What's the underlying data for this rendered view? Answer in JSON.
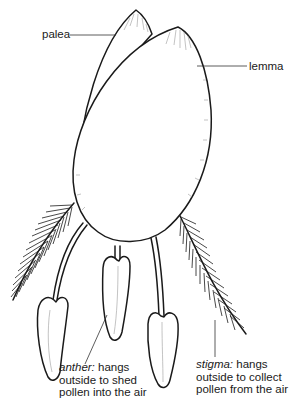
{
  "diagram": {
    "labels": {
      "palea": "palea",
      "lemma": "lemma",
      "anther": {
        "term": "anther:",
        "line1_rest": " hangs",
        "line2": "outside to shed",
        "line3": "pollen into the air"
      },
      "stigma": {
        "term": "stigma:",
        "line1_rest": " hangs",
        "line2": "outside to collect",
        "line3": "pollen from the air"
      }
    },
    "parts": [
      "palea",
      "lemma",
      "stigma-left",
      "stigma-right",
      "anther-left",
      "anther-middle",
      "anther-right"
    ],
    "colors": {
      "ink": "#1a1a1a",
      "background": "#ffffff"
    }
  }
}
